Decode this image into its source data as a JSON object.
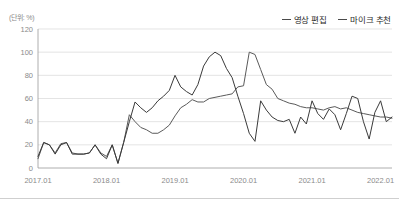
{
  "unit_label": "(단위: %)",
  "legend": {
    "position": "top-right",
    "items": [
      {
        "label": "영상 편집",
        "color": "#5a5a5a"
      },
      {
        "label": "마이크 추천",
        "color": "#3a3a3a"
      }
    ]
  },
  "chart_data": {
    "type": "line",
    "title": "",
    "subtitle": "",
    "xlabel": "",
    "ylabel": "(단위: %)",
    "ylim": [
      0,
      120
    ],
    "yticks": [
      0,
      20,
      40,
      60,
      80,
      100,
      120
    ],
    "ytick_labels": [
      "0",
      "20",
      "40",
      "60",
      "80",
      "100",
      "120"
    ],
    "xticks": [
      "2017.01",
      "2018.01",
      "2019.01",
      "2020.01",
      "2021.01",
      "2022.01"
    ],
    "xtick_labels": [
      "2017.01",
      "2018.01",
      "2019.01",
      "2020.01",
      "2021.01",
      "2022.01"
    ],
    "grid": true,
    "x": [
      "2017.01",
      "2017.02",
      "2017.03",
      "2017.04",
      "2017.05",
      "2017.06",
      "2017.07",
      "2017.08",
      "2017.09",
      "2017.10",
      "2017.11",
      "2017.12",
      "2018.01",
      "2018.02",
      "2018.03",
      "2018.04",
      "2018.05",
      "2018.06",
      "2018.07",
      "2018.08",
      "2018.09",
      "2018.10",
      "2018.11",
      "2018.12",
      "2019.01",
      "2019.02",
      "2019.03",
      "2019.04",
      "2019.05",
      "2019.06",
      "2019.07",
      "2019.08",
      "2019.09",
      "2019.10",
      "2019.11",
      "2019.12",
      "2020.01",
      "2020.02",
      "2020.03",
      "2020.04",
      "2020.05",
      "2020.06",
      "2020.07",
      "2020.08",
      "2020.09",
      "2020.10",
      "2020.11",
      "2020.12",
      "2021.01",
      "2021.02",
      "2021.03",
      "2021.04",
      "2021.05",
      "2021.06",
      "2021.07",
      "2021.08",
      "2021.09",
      "2021.10",
      "2021.11",
      "2021.12",
      "2022.01",
      "2022.02",
      "2022.03"
    ],
    "series": [
      {
        "name": "영상 편집",
        "color": "#5a5a5a",
        "values": [
          8,
          22,
          20,
          13,
          21,
          22,
          13,
          12,
          12,
          13,
          20,
          13,
          10,
          20,
          4,
          22,
          46,
          40,
          35,
          33,
          30,
          30,
          33,
          37,
          45,
          52,
          55,
          59,
          57,
          57,
          60,
          61,
          62,
          63,
          64,
          70,
          71,
          100,
          98,
          85,
          72,
          68,
          60,
          58,
          56,
          55,
          53,
          52,
          52,
          51,
          50,
          52,
          53,
          51,
          52,
          50,
          48,
          47,
          46,
          45,
          44,
          44,
          43
        ]
      },
      {
        "name": "마이크 추천",
        "color": "#3a3a3a",
        "values": [
          10,
          22,
          20,
          12,
          20,
          22,
          12,
          12,
          12,
          13,
          20,
          12,
          8,
          20,
          4,
          22,
          40,
          57,
          52,
          48,
          52,
          58,
          62,
          67,
          80,
          70,
          66,
          63,
          72,
          88,
          96,
          100,
          97,
          86,
          78,
          62,
          47,
          30,
          23,
          58,
          50,
          44,
          41,
          40,
          42,
          30,
          44,
          38,
          58,
          47,
          42,
          51,
          46,
          33,
          47,
          62,
          60,
          40,
          25,
          48,
          58,
          40,
          44
        ]
      }
    ]
  },
  "layout": {
    "plot_left": 38,
    "plot_right": 392,
    "plot_top": 29,
    "plot_bottom": 168
  }
}
